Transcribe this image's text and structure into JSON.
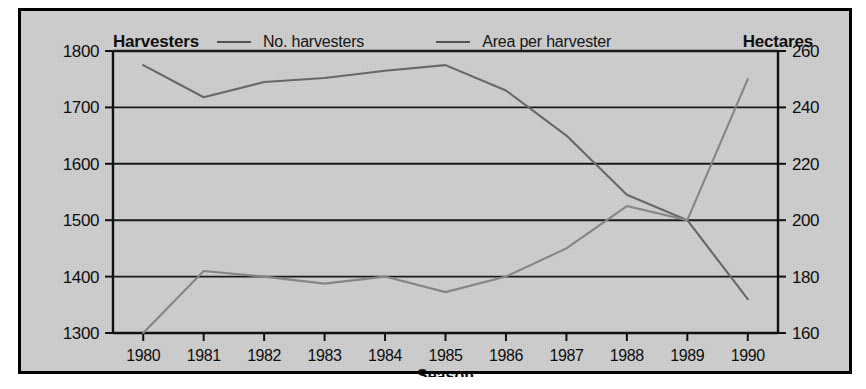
{
  "chart_data": {
    "type": "line",
    "title": "",
    "xlabel": "Season",
    "categories": [
      "1980",
      "1981",
      "1982",
      "1983",
      "1984",
      "1985",
      "1986",
      "1987",
      "1988",
      "1989",
      "1990"
    ],
    "grid": true,
    "legend_position": "top",
    "axes": {
      "left": {
        "label": "Harvesters",
        "ylim": [
          1300,
          1800
        ],
        "ticks": [
          1300,
          1400,
          1500,
          1600,
          1700,
          1800
        ],
        "tick_labels": [
          "1300",
          "1400",
          "1500",
          "1600",
          "1700",
          "1800"
        ]
      },
      "right": {
        "label": "Hectares",
        "ylim": [
          160,
          260
        ],
        "ticks": [
          160,
          180,
          200,
          220,
          240,
          260
        ],
        "tick_labels": [
          "160",
          "180",
          "200",
          "220",
          "240",
          "260"
        ]
      }
    },
    "series": [
      {
        "name": "No. harvesters",
        "axis": "left",
        "color": "#6b6b6b",
        "values": [
          1775,
          1718,
          1745,
          1752,
          1765,
          1775,
          1730,
          1650,
          1545,
          1500,
          1360
        ]
      },
      {
        "name": "Area per harvester",
        "axis": "right",
        "color": "#8a8a8a",
        "values": [
          160,
          182,
          180,
          177.5,
          180,
          174.5,
          180,
          190,
          205,
          200,
          250
        ]
      }
    ]
  },
  "legend": {
    "left_axis_title": "Harvesters",
    "right_axis_title": "Hectares",
    "entries": [
      {
        "label": "No. harvesters"
      },
      {
        "label": "Area per harvester"
      }
    ]
  },
  "colors": {
    "paper": "#d2d2d2",
    "frame": "#000000",
    "gridline": "#1a1a1a",
    "series_1": "#6b6b6b",
    "series_2": "#8a8a8a"
  }
}
